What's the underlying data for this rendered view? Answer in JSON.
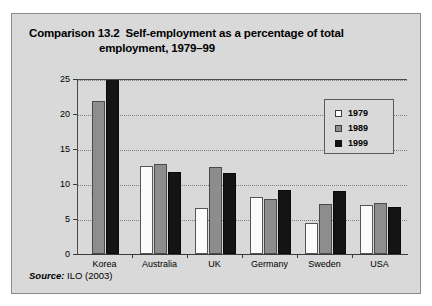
{
  "figure": {
    "title_line1": "Comparison 13.2  Self-employment as a percentage of total",
    "title_line2": "employment, 1979–99",
    "source_word": "Source:",
    "source_value": " ILO (2003)"
  },
  "legend": {
    "entries": [
      {
        "label": "1979",
        "swatch": "white-square-icon",
        "color": "#ffffff"
      },
      {
        "label": "1989",
        "swatch": "gray-square-icon",
        "color": "#8d8d8d"
      },
      {
        "label": "1999",
        "swatch": "black-square-icon",
        "color": "#111111"
      }
    ]
  },
  "chart_data": {
    "type": "bar",
    "title": "Comparison 13.2  Self-employment as a percentage of total employment, 1979–99",
    "xlabel": "",
    "ylabel": "Per cent of total employment",
    "ylim": [
      0,
      25
    ],
    "ytick_values": [
      0,
      5,
      10,
      15,
      20,
      25
    ],
    "ytick_labels": [
      "0",
      "5",
      "10",
      "15",
      "20",
      "25"
    ],
    "grid": true,
    "legend_position": "upper right",
    "categories": [
      "Korea",
      "Australia",
      "UK",
      "Germany",
      "Sweden",
      "USA"
    ],
    "series": [
      {
        "name": "1979",
        "color": "#ffffff",
        "values": [
          null,
          12.6,
          6.6,
          8.1,
          4.4,
          7.0
        ]
      },
      {
        "name": "1989",
        "color": "#8d8d8d",
        "values": [
          21.8,
          12.9,
          12.4,
          7.9,
          7.1,
          7.3
        ]
      },
      {
        "name": "1999",
        "color": "#111111",
        "values": [
          25.0,
          11.7,
          11.6,
          9.1,
          9.0,
          6.7
        ]
      }
    ],
    "source": "Source: ILO (2003)"
  }
}
